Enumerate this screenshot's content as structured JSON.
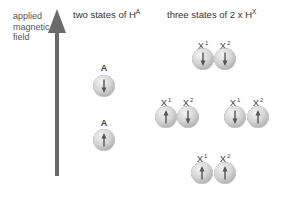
{
  "field_label": {
    "lines": [
      "applied",
      "magnetic",
      "field"
    ]
  },
  "titles": {
    "left": {
      "text": "two states of H",
      "sup": "A"
    },
    "right": {
      "text": "three states of 2 x H",
      "sup": "X"
    }
  },
  "colors": {
    "arrow": "#6a6a6a",
    "sphere_light": "#f4f4f4",
    "sphere_dark": "#a8a8a8",
    "spin_arrow": "#555555"
  },
  "a_states": [
    {
      "label": "A",
      "spin": "down"
    },
    {
      "label": "A",
      "spin": "up"
    }
  ],
  "x_states": [
    {
      "x1": {
        "label": "X",
        "sup": "1",
        "spin": "down"
      },
      "x2": {
        "label": "X",
        "sup": "2",
        "spin": "down"
      }
    },
    {
      "x1": {
        "label": "X",
        "sup": "1",
        "spin": "up"
      },
      "x2": {
        "label": "X",
        "sup": "2",
        "spin": "down"
      }
    },
    {
      "x1": {
        "label": "X",
        "sup": "1",
        "spin": "down"
      },
      "x2": {
        "label": "X",
        "sup": "2",
        "spin": "up"
      }
    },
    {
      "x1": {
        "label": "X",
        "sup": "1",
        "spin": "up"
      },
      "x2": {
        "label": "X",
        "sup": "2",
        "spin": "up"
      }
    }
  ]
}
